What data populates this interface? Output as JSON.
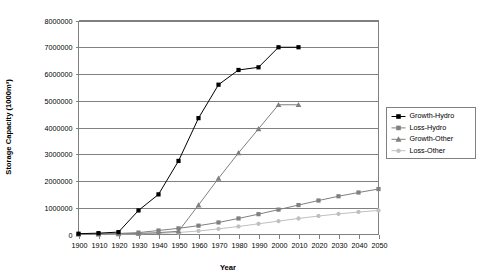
{
  "chart_data": {
    "type": "line",
    "title": "",
    "xlabel": "Year",
    "ylabel": "Storage Capacity (1000m³)",
    "xlim": [
      1900,
      2050
    ],
    "ylim": [
      0,
      8000000
    ],
    "grid": true,
    "legend_position": "right",
    "x_ticks": [
      1900,
      1910,
      1920,
      1930,
      1940,
      1950,
      1960,
      1970,
      1980,
      1990,
      2000,
      2010,
      2020,
      2030,
      2040,
      2050
    ],
    "y_ticks": [
      0,
      1000000,
      2000000,
      3000000,
      4000000,
      5000000,
      6000000,
      7000000,
      8000000
    ],
    "y_tick_labels": [
      "0",
      "1000000",
      "2000000",
      "3000000",
      "4000000",
      "5000000",
      "6000000",
      "7000000",
      "8000000"
    ],
    "x_tick_labels": [
      "1900",
      "1910",
      "1920",
      "1930",
      "1940",
      "1950",
      "1960",
      "1970",
      "1980",
      "1990",
      "2000",
      "2010",
      "2020",
      "2030",
      "2040",
      "2050"
    ],
    "series": [
      {
        "name": "Growth-Hydro",
        "color": "#000000",
        "marker": "square",
        "x": [
          1900,
          1910,
          1920,
          1930,
          1940,
          1950,
          1960,
          1970,
          1980,
          1990,
          2000,
          2010
        ],
        "values": [
          30000,
          50000,
          90000,
          900000,
          1500000,
          2750000,
          4350000,
          5600000,
          6150000,
          6250000,
          7000000,
          7000000
        ]
      },
      {
        "name": "Loss-Hydro",
        "color": "#808080",
        "marker": "square",
        "x": [
          1900,
          1910,
          1920,
          1930,
          1940,
          1950,
          1960,
          1970,
          1980,
          1990,
          2000,
          2010,
          2020,
          2030,
          2040,
          2050
        ],
        "values": [
          10000,
          20000,
          40000,
          70000,
          150000,
          230000,
          330000,
          450000,
          600000,
          760000,
          930000,
          1100000,
          1270000,
          1430000,
          1570000,
          1700000
        ]
      },
      {
        "name": "Growth-Other",
        "color": "#808080",
        "marker": "triangle",
        "x": [
          1900,
          1910,
          1920,
          1930,
          1940,
          1950,
          1960,
          1970,
          1980,
          1990,
          2000,
          2010
        ],
        "values": [
          10000,
          15000,
          25000,
          40000,
          70000,
          120000,
          1100000,
          2100000,
          3050000,
          3950000,
          4850000,
          4850000
        ]
      },
      {
        "name": "Loss-Other",
        "color": "#c0c0c0",
        "marker": "star",
        "x": [
          1900,
          1910,
          1920,
          1930,
          1940,
          1950,
          1960,
          1970,
          1980,
          1990,
          2000,
          2010,
          2020,
          2030,
          2040,
          2050
        ],
        "values": [
          5000,
          8000,
          15000,
          25000,
          45000,
          75000,
          130000,
          210000,
          300000,
          400000,
          500000,
          600000,
          690000,
          770000,
          840000,
          900000
        ]
      }
    ]
  },
  "legend": {
    "items": [
      {
        "label": "Growth-Hydro"
      },
      {
        "label": "Loss-Hydro"
      },
      {
        "label": "Growth-Other"
      },
      {
        "label": "Loss-Other"
      }
    ]
  }
}
